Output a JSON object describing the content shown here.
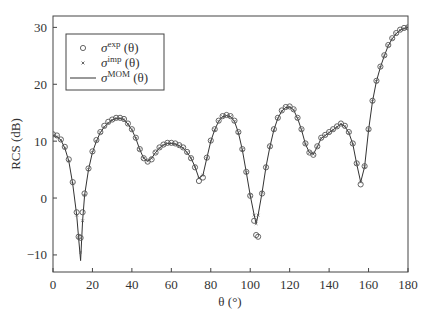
{
  "chart_data": {
    "type": "line",
    "title": "",
    "xlabel": "θ (°)",
    "ylabel": "RCS (dB)",
    "xlim": [
      0,
      180
    ],
    "ylim": [
      -13,
      32
    ],
    "xticks": [
      0,
      20,
      40,
      60,
      80,
      100,
      120,
      140,
      160,
      180
    ],
    "yticks": [
      -10,
      0,
      10,
      20,
      30
    ],
    "grid": false,
    "legend_position": "upper left",
    "legend": [
      {
        "marker": "circle",
        "label_base": "σ",
        "label_sup": "exp",
        "label_tail": " (θ)"
      },
      {
        "marker": "x",
        "label_base": "σ",
        "label_sup": "imp",
        "label_tail": " (θ)"
      },
      {
        "marker": "line",
        "label_base": "σ",
        "label_sup": "MOM",
        "label_tail": " (θ)"
      }
    ],
    "x": [
      0,
      2,
      4,
      6,
      8,
      10,
      12,
      13,
      14,
      15,
      16,
      18,
      20,
      22,
      24,
      26,
      28,
      30,
      32,
      34,
      36,
      38,
      40,
      42,
      44,
      46,
      48,
      50,
      52,
      54,
      56,
      58,
      60,
      62,
      64,
      66,
      68,
      70,
      72,
      74,
      76,
      78,
      80,
      82,
      84,
      86,
      88,
      90,
      92,
      94,
      96,
      98,
      100,
      102,
      103,
      104,
      106,
      108,
      110,
      112,
      114,
      116,
      118,
      120,
      122,
      124,
      126,
      128,
      130,
      132,
      134,
      136,
      138,
      140,
      142,
      144,
      146,
      148,
      150,
      152,
      154,
      156,
      158,
      160,
      162,
      164,
      166,
      168,
      170,
      172,
      174,
      176,
      178,
      180
    ],
    "series": [
      {
        "name": "σ_MOM(θ)",
        "style": "line",
        "values": [
          11.0,
          10.8,
          10.2,
          8.8,
          6.5,
          2.5,
          -3.0,
          -7.0,
          -11.0,
          -4.0,
          0.5,
          5.0,
          8.0,
          10.0,
          11.5,
          12.5,
          13.2,
          13.7,
          14.0,
          14.0,
          13.8,
          13.0,
          12.0,
          10.5,
          8.5,
          7.0,
          6.5,
          7.0,
          8.0,
          8.8,
          9.3,
          9.6,
          9.6,
          9.5,
          9.2,
          8.8,
          8.0,
          7.0,
          5.5,
          3.5,
          4.0,
          7.0,
          10.0,
          12.0,
          13.5,
          14.3,
          14.5,
          14.3,
          13.5,
          11.5,
          8.5,
          4.5,
          0.5,
          -3.0,
          -4.5,
          -3.0,
          1.0,
          5.5,
          9.0,
          12.0,
          14.0,
          15.3,
          15.9,
          16.0,
          15.5,
          14.0,
          12.0,
          9.5,
          8.0,
          7.7,
          9.0,
          10.5,
          11.0,
          11.5,
          12.0,
          12.5,
          13.0,
          12.6,
          11.5,
          9.5,
          6.0,
          2.8,
          5.5,
          12.0,
          17.0,
          20.5,
          23.0,
          25.0,
          26.8,
          28.0,
          28.9,
          29.5,
          29.8,
          30.0
        ]
      },
      {
        "name": "σ_exp(θ)",
        "style": "circle",
        "values": [
          11.2,
          11.0,
          10.3,
          9.0,
          6.8,
          2.8,
          -2.5,
          -6.8,
          -7.0,
          -2.5,
          0.8,
          5.2,
          8.2,
          10.2,
          11.6,
          12.7,
          13.4,
          13.8,
          14.1,
          14.1,
          13.9,
          13.1,
          12.1,
          10.6,
          8.6,
          7.0,
          6.4,
          6.8,
          8.0,
          8.9,
          9.4,
          9.7,
          9.7,
          9.6,
          9.3,
          8.9,
          8.1,
          7.0,
          5.4,
          3.0,
          3.6,
          7.1,
          10.1,
          12.1,
          13.6,
          14.4,
          14.6,
          14.4,
          13.6,
          11.6,
          8.6,
          4.6,
          0.4,
          -4.0,
          -6.5,
          -6.8,
          0.8,
          5.4,
          9.1,
          12.1,
          14.1,
          15.4,
          16.0,
          16.1,
          15.6,
          14.1,
          12.1,
          9.6,
          8.0,
          7.6,
          9.1,
          10.6,
          11.1,
          11.6,
          12.1,
          12.6,
          13.1,
          12.7,
          11.6,
          9.6,
          6.1,
          2.4,
          5.6,
          12.1,
          17.1,
          20.6,
          23.1,
          25.1,
          26.9,
          28.1,
          29.0,
          29.6,
          29.9,
          30.0
        ]
      },
      {
        "name": "σ_imp(θ)",
        "style": "x",
        "values": [
          11.0,
          10.8,
          10.2,
          8.8,
          6.5,
          2.5,
          -3.0,
          -7.0,
          -9.5,
          -4.0,
          0.5,
          5.0,
          8.0,
          10.0,
          11.5,
          12.5,
          13.2,
          13.7,
          14.0,
          14.0,
          13.8,
          13.0,
          12.0,
          10.5,
          8.5,
          7.0,
          6.5,
          7.0,
          8.0,
          8.8,
          9.3,
          9.6,
          9.6,
          9.5,
          9.2,
          8.8,
          8.0,
          7.0,
          5.5,
          3.5,
          4.0,
          7.0,
          10.0,
          12.0,
          13.5,
          14.3,
          14.5,
          14.3,
          13.5,
          11.5,
          8.5,
          4.5,
          0.5,
          -3.0,
          -4.5,
          -3.0,
          1.0,
          5.5,
          9.0,
          12.0,
          14.0,
          15.3,
          15.9,
          16.0,
          15.5,
          14.0,
          12.0,
          9.5,
          8.0,
          7.7,
          9.0,
          10.5,
          11.0,
          11.5,
          12.0,
          12.5,
          13.0,
          12.6,
          11.5,
          9.5,
          6.0,
          2.8,
          5.5,
          12.0,
          17.0,
          20.5,
          23.0,
          25.0,
          26.8,
          28.0,
          28.9,
          29.5,
          29.8,
          30.0
        ]
      }
    ]
  },
  "plot": {
    "left": 53,
    "right": 408,
    "top": 16,
    "bottom": 272,
    "colors": {
      "axis": "#444444",
      "line": "#333333",
      "marker": "#555555",
      "text": "#333333"
    }
  }
}
